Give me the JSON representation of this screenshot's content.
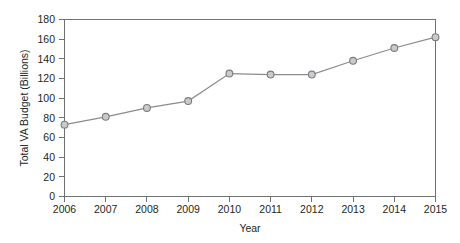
{
  "chart_data": {
    "type": "line",
    "title": "",
    "xlabel": "Year",
    "ylabel": "Total VA Budget (Billions)",
    "categories": [
      "2006",
      "2007",
      "2008",
      "2009",
      "2010",
      "2011",
      "2012",
      "2013",
      "2014",
      "2015"
    ],
    "values": [
      73,
      81,
      90,
      97,
      125,
      124,
      124,
      138,
      151,
      162
    ],
    "series": [
      {
        "name": "Total VA Budget (Billions)",
        "values": [
          73,
          81,
          90,
          97,
          125,
          124,
          124,
          138,
          151,
          162
        ]
      }
    ],
    "xlim": [
      2006,
      2015
    ],
    "ylim": [
      0,
      180
    ],
    "y_ticks": [
      0,
      20,
      40,
      60,
      80,
      100,
      120,
      140,
      160,
      180
    ],
    "x_ticks": [
      "2006",
      "2007",
      "2008",
      "2009",
      "2010",
      "2011",
      "2012",
      "2013",
      "2014",
      "2015"
    ],
    "grid": false,
    "legend": false,
    "legend_position": "none",
    "marker": "circle",
    "colors": {
      "line": "#8a8b8e",
      "marker_fill": "#c9cacb",
      "marker_stroke": "#7b7c7f",
      "axis": "#6f7072",
      "text": "#231f20",
      "background": "#ffffff"
    }
  },
  "axis": {
    "y_tick_labels": [
      "180",
      "160",
      "140",
      "120",
      "100",
      "80",
      "60",
      "40",
      "20",
      "0"
    ],
    "x_tick_labels": [
      "2006",
      "2007",
      "2008",
      "2009",
      "2010",
      "2011",
      "2012",
      "2013",
      "2014",
      "2015"
    ],
    "y_title": "Total VA Budget (Billions)",
    "x_title": "Year"
  }
}
